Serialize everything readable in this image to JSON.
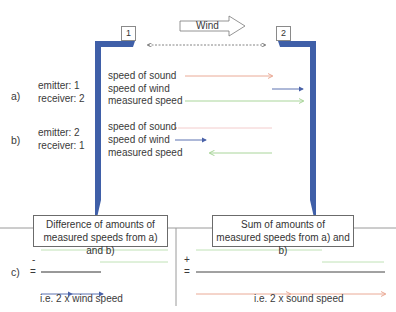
{
  "top": {
    "box_1": "1",
    "box_2": "2",
    "wind_label": "Wind"
  },
  "section_a": {
    "label": "a)",
    "emitter": "emitter:  1",
    "receiver": "receiver: 2",
    "rows": [
      "speed of sound",
      "speed of wind",
      "measured speed"
    ]
  },
  "section_b": {
    "label": "b)",
    "emitter": "emitter: 2",
    "receiver": "receiver:  1",
    "rows": [
      "speed of sound",
      "speed of wind",
      "measured speed"
    ]
  },
  "section_c": {
    "label": "c)",
    "minus": "-",
    "plus": "+",
    "equals": "=",
    "difference_box": [
      "Difference of amounts of",
      "measured speeds from a) and b)"
    ],
    "sum_box": [
      "Sum of amounts of",
      "measured speeds from a) and b)"
    ],
    "difference_result": "i.e. 2 x wind speed",
    "sum_result": "i.e. 2 x sound speed"
  },
  "colors": {
    "wall": "#3f5fa8",
    "sound": "#e8a08a",
    "wind": "#4a62a8",
    "measured": "#9fd08f",
    "result": "#333333"
  }
}
